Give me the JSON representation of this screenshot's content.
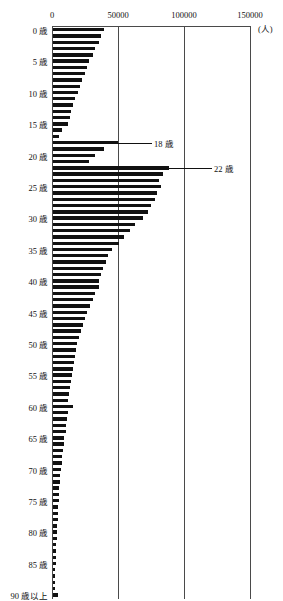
{
  "chart_data": {
    "type": "bar",
    "orientation": "horizontal",
    "title": "",
    "xlabel": "",
    "ylabel": "",
    "unit_label": "(人)",
    "xlim": [
      0,
      150000
    ],
    "xticks": [
      0,
      50000,
      100000,
      150000
    ],
    "xtick_labels": [
      "0",
      "50000",
      "100000",
      "150000"
    ],
    "grid": true,
    "grid_axis": "x",
    "legend": "none",
    "axis_position": "top",
    "category_label_suffix": "歳",
    "last_category_label": "90 歳以上",
    "ytick_labels": [
      "0 歳",
      "5 歳",
      "10 歳",
      "15 歳",
      "20 歳",
      "25 歳",
      "30 歳",
      "35 歳",
      "40 歳",
      "45 歳",
      "50 歳",
      "55 歳",
      "60 歳",
      "65 歳",
      "70 歳",
      "75 歳",
      "80 歳",
      "85 歳",
      "90 歳以上"
    ],
    "ytick_ages": [
      0,
      5,
      10,
      15,
      20,
      25,
      30,
      35,
      40,
      45,
      50,
      55,
      60,
      65,
      70,
      75,
      80,
      85,
      90
    ],
    "categories": [
      "0",
      "1",
      "2",
      "3",
      "4",
      "5",
      "6",
      "7",
      "8",
      "9",
      "10",
      "11",
      "12",
      "13",
      "14",
      "15",
      "16",
      "17",
      "18",
      "19",
      "20",
      "21",
      "22",
      "23",
      "24",
      "25",
      "26",
      "27",
      "28",
      "29",
      "30",
      "31",
      "32",
      "33",
      "34",
      "35",
      "36",
      "37",
      "38",
      "39",
      "40",
      "41",
      "42",
      "43",
      "44",
      "45",
      "46",
      "47",
      "48",
      "49",
      "50",
      "51",
      "52",
      "53",
      "54",
      "55",
      "56",
      "57",
      "58",
      "59",
      "60",
      "61",
      "62",
      "63",
      "64",
      "65",
      "66",
      "67",
      "68",
      "69",
      "70",
      "71",
      "72",
      "73",
      "74",
      "75",
      "76",
      "77",
      "78",
      "79",
      "80",
      "81",
      "82",
      "83",
      "84",
      "85",
      "86",
      "87",
      "88",
      "89",
      "90+"
    ],
    "values": [
      39000,
      36500,
      34500,
      31500,
      30000,
      27500,
      26000,
      24500,
      22000,
      20500,
      19000,
      17000,
      15500,
      13500,
      12500,
      11000,
      7000,
      4500,
      49000,
      39000,
      31500,
      27000,
      88000,
      83000,
      80000,
      82000,
      79000,
      77000,
      74000,
      72000,
      68000,
      62000,
      58000,
      54000,
      50000,
      45000,
      42000,
      40000,
      38000,
      36500,
      35000,
      34500,
      32000,
      30000,
      28000,
      25500,
      24000,
      22500,
      21000,
      19500,
      18500,
      17500,
      17000,
      16000,
      15500,
      14500,
      13500,
      12500,
      12000,
      11500,
      15000,
      11000,
      10500,
      10000,
      9500,
      8500,
      8000,
      7500,
      7000,
      6500,
      6000,
      5500,
      5000,
      4800,
      4500,
      4200,
      4000,
      3800,
      3500,
      3200,
      3000,
      2800,
      2600,
      2400,
      2200,
      2000,
      1800,
      1600,
      1400,
      1300,
      4000
    ],
    "annotations": [
      {
        "label": "18 歳",
        "age": 18,
        "value": 49000
      },
      {
        "label": "22 歳",
        "age": 22,
        "value": 88000
      }
    ]
  }
}
